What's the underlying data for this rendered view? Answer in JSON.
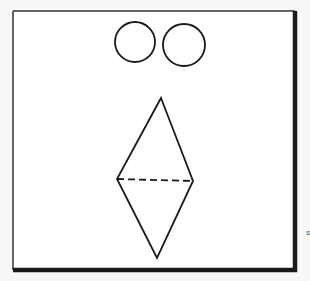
{
  "figure": {
    "background": "#f7f7f5",
    "frame": {
      "x": 13,
      "y": 11,
      "width": 282,
      "height": 259,
      "thin_stroke": "#333333",
      "thick_stroke": "#1a1a1a",
      "fill": "#ffffff"
    },
    "circles": [
      {
        "name": "left-circle",
        "cx": 135,
        "cy": 42,
        "r": 20
      },
      {
        "name": "right-circle",
        "cx": 184,
        "cy": 45,
        "r": 21
      }
    ],
    "diamond": {
      "top": [
        161,
        98
      ],
      "left": [
        117,
        179
      ],
      "right": [
        193,
        181
      ],
      "bottom": [
        157,
        258
      ],
      "stroke": "#1a1a1a"
    },
    "dashed_line": {
      "from": [
        117,
        179
      ],
      "to": [
        193,
        181
      ],
      "dash": "7,4"
    },
    "margin_mark": {
      "text": "s",
      "x": 306,
      "y": 228
    }
  }
}
